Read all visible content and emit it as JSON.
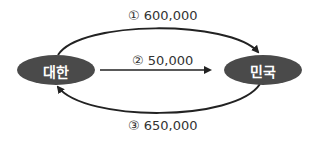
{
  "nodes": [
    {
      "id": "left",
      "label": "대한"
    },
    {
      "id": "right",
      "label": "민국"
    }
  ],
  "flows": [
    {
      "marker": "①",
      "value": "600,000",
      "label": "① 600,000",
      "from": "대한",
      "to": "민국"
    },
    {
      "marker": "②",
      "value": "50,000",
      "label": "② 50,000",
      "from": "대한",
      "to": "민국"
    },
    {
      "marker": "③",
      "value": "650,000",
      "label": "③ 650,000",
      "from": "민국",
      "to": "대한"
    }
  ],
  "colors": {
    "node_fill": "#4a4a4a",
    "arrow": "#222222",
    "text": "#333333"
  }
}
